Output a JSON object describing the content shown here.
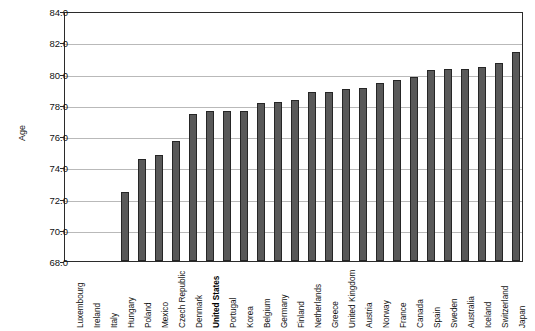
{
  "chart_data": {
    "type": "bar",
    "title": "",
    "subtitle": "",
    "xlabel": "",
    "ylabel": "Age",
    "ylim": [
      68.0,
      84.0
    ],
    "ytick_step": 2.0,
    "yticks": [
      "68.0",
      "70.0",
      "72.0",
      "74.0",
      "76.0",
      "78.0",
      "80.0",
      "82.0",
      "84.0"
    ],
    "ytick_values": [
      68.0,
      70.0,
      72.0,
      74.0,
      76.0,
      78.0,
      80.0,
      82.0,
      84.0
    ],
    "grid": true,
    "grid_axis": "y",
    "legend": false,
    "legend_position": "none",
    "bar_color": "#595959",
    "bar_edge_color": "#262626",
    "highlight_category": "United States",
    "categories": [
      "Luxembourg",
      "Ireland",
      "Italy",
      "Hungary",
      "Poland",
      "Mexico",
      "Czech Republic",
      "Denmark",
      "United States",
      "Portugal",
      "Korea",
      "Belgium",
      "Germany",
      "Finland",
      "Netherlands",
      "Greece",
      "United Kingdom",
      "Austria",
      "Norway",
      "France",
      "Canada",
      "Spain",
      "Sweden",
      "Australia",
      "Iceland",
      "Switzerland",
      "Japan"
    ],
    "values": [
      null,
      null,
      null,
      72.4,
      74.5,
      74.8,
      75.7,
      77.4,
      77.6,
      77.6,
      77.6,
      78.1,
      78.2,
      78.3,
      78.8,
      78.8,
      79.0,
      79.1,
      79.4,
      79.6,
      79.8,
      80.2,
      80.3,
      80.3,
      80.4,
      80.7,
      81.4
    ]
  }
}
